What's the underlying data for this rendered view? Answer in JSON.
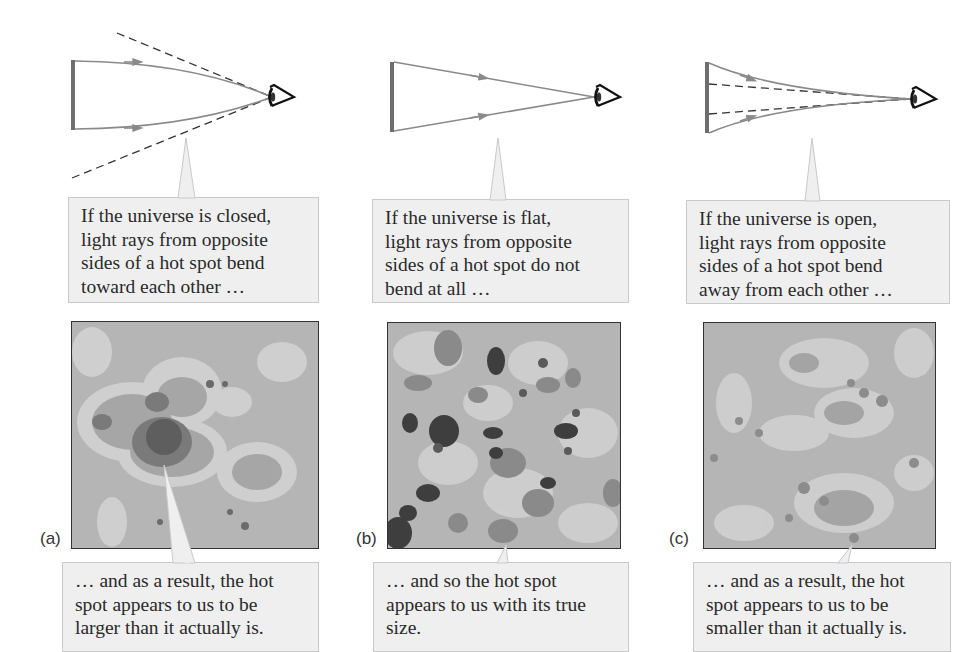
{
  "figure": {
    "panels": [
      {
        "id": "a",
        "label": "(a)",
        "geometry": "closed",
        "top_callout": {
          "lines": [
            "If the universe is closed,",
            "light rays from opposite",
            "sides of a hot spot bend",
            "toward each other …"
          ]
        },
        "bottom_callout": {
          "lines": [
            "… and as a result, the hot",
            "spot appears to us to be",
            "larger than it actually is."
          ]
        },
        "map_description": "CMB simulation with one large dark hot spot"
      },
      {
        "id": "b",
        "label": "(b)",
        "geometry": "flat",
        "top_callout": {
          "lines": [
            "If the universe is flat,",
            "light rays from opposite",
            "sides of a hot spot do not",
            "bend at all …"
          ]
        },
        "bottom_callout": {
          "lines": [
            "… and so the hot spot",
            "appears to us with its true",
            "size."
          ]
        },
        "map_description": "CMB simulation with medium-sized dark hot spots"
      },
      {
        "id": "c",
        "label": "(c)",
        "geometry": "open",
        "top_callout": {
          "lines": [
            "If the universe is open,",
            "light rays from opposite",
            "sides of a hot spot bend",
            "away from each other …"
          ]
        },
        "bottom_callout": {
          "lines": [
            "… and as a result, the hot",
            "spot appears to us to be",
            "smaller than it actually is."
          ]
        },
        "map_description": "CMB simulation with small faint hot spots"
      }
    ],
    "colors": {
      "ray": "#8a8a8a",
      "source_bar": "#6e6e6e",
      "dashed": "#333333",
      "callout_bg": "#efefef",
      "callout_border": "#c9c9c9",
      "map_bg": "#b3b3b3",
      "map_light": "#d4d4d4",
      "map_dark": "#3c3c3c"
    }
  }
}
